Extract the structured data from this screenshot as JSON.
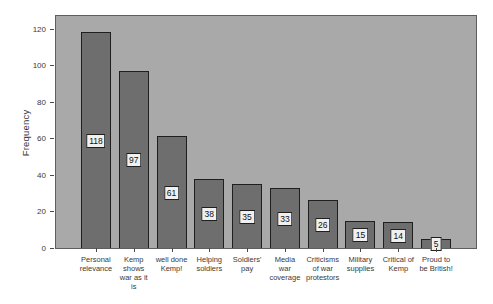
{
  "chart_data": {
    "type": "bar",
    "title": "",
    "xlabel": "",
    "ylabel": "Frequency",
    "categories": [
      "Personal relevance",
      "Kemp shows war as it is",
      "well done Kemp!",
      "Helping soldiers",
      "Soldiers' pay",
      "Media war coverage",
      "Criticisms of war protestors",
      "Military supplies",
      "Critical of Kemp",
      "Proud to be British!"
    ],
    "category_lines": [
      [
        "Personal",
        "relevance"
      ],
      [
        "Kemp",
        "shows",
        "war as it",
        "is"
      ],
      [
        "well done",
        "Kemp!"
      ],
      [
        "Helping",
        "soldiers"
      ],
      [
        "Soldiers'",
        "pay"
      ],
      [
        "Media",
        "war",
        "coverage"
      ],
      [
        "Criticisms",
        "of war",
        "protestors"
      ],
      [
        "Military",
        "supplies"
      ],
      [
        "Critical of",
        "Kemp"
      ],
      [
        "Proud to",
        "be British!"
      ]
    ],
    "values": [
      118,
      97,
      61,
      38,
      35,
      33,
      26,
      15,
      14,
      5
    ],
    "bar_value_labels": [
      "118",
      "97",
      "61",
      "38",
      "35",
      "33",
      "26",
      "15",
      "14",
      "5"
    ],
    "yticks": [
      0,
      20,
      40,
      60,
      80,
      100,
      120
    ],
    "ylim": [
      0,
      128
    ],
    "grid": false,
    "legend": null,
    "colors": {
      "page_background": "#ffffff",
      "plot_background": "#a9a9a9",
      "plot_border": "#5e5e5e",
      "bar_fill": "#6e6e6e",
      "bar_border": "#1f1f1f",
      "value_box_background": "#f0f0f0",
      "value_box_border": "#1f1f1f",
      "axis_text": "#3a3a3a"
    }
  }
}
